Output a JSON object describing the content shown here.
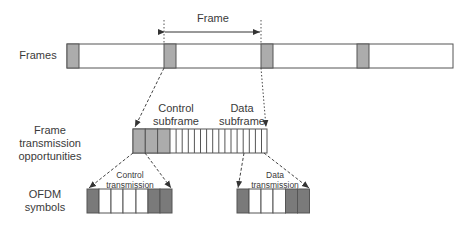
{
  "labels": {
    "frame_span": "Frame",
    "row_frames": "Frames",
    "row_opportunities_1": "Frame",
    "row_opportunities_2": "transmission",
    "row_opportunities_3": "opportunities",
    "row_ofdm_1": "OFDM",
    "row_ofdm_2": "symbols",
    "control_subframe_1": "Control",
    "control_subframe_2": "subframe",
    "data_subframe_1": "Data",
    "data_subframe_2": "subframe",
    "control_tx_1": "Control",
    "control_tx_2": "transmission",
    "data_tx_1": "Data",
    "data_tx_2": "transmission"
  },
  "structure": {
    "frames_row": {
      "frame_count_visible": 4,
      "header_cells": "gray"
    },
    "transmission_opportunities": {
      "control_cells": 3,
      "data_cells": 16
    },
    "control_transmission_symbols": [
      "dark",
      "white",
      "white",
      "white",
      "white",
      "dark",
      "dark"
    ],
    "data_transmission_symbols": [
      "dark",
      "white",
      "white",
      "white",
      "dark",
      "dark"
    ]
  },
  "colors": {
    "light_gray": "#acacac",
    "dark_gray": "#7a7a7a",
    "stroke": "#555555"
  }
}
